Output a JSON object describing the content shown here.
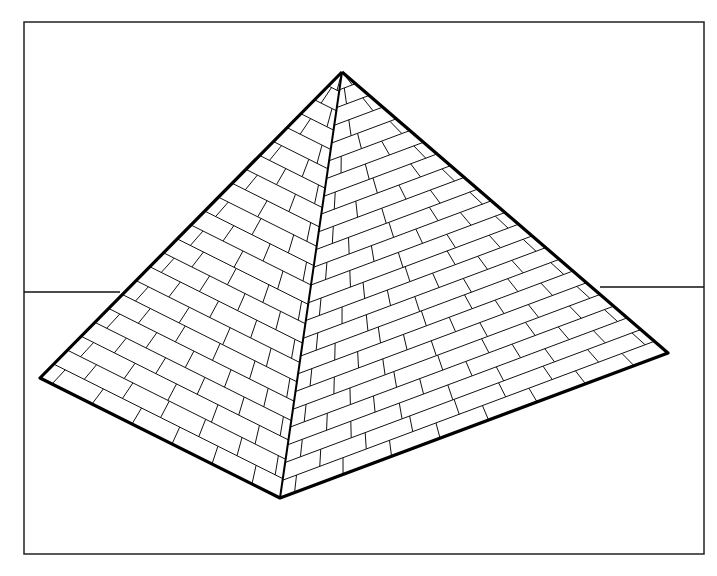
{
  "figure": {
    "style": "line-art",
    "colors": {
      "ink": "#000000",
      "paper": "#ffffff"
    }
  },
  "geometry": {
    "frame": {
      "x": 24,
      "y": 22,
      "width": 680,
      "height": 532
    },
    "apex": [
      342,
      72
    ],
    "left_corner": [
      40,
      378
    ],
    "front_corner": [
      280,
      498
    ],
    "right_corner": [
      668,
      353
    ],
    "horizon_left_y": 292,
    "horizon_right_y": 287,
    "left_face_courses": 22,
    "right_face_courses": 24
  }
}
